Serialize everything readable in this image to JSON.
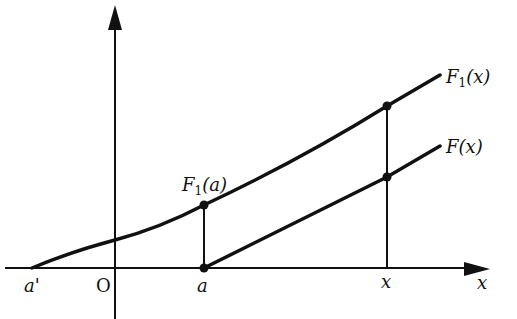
{
  "diagram": {
    "axes": {
      "x_label": "x",
      "origin_label": "O"
    },
    "x_ticks": [
      {
        "label": "a'",
        "px": 32
      },
      {
        "label": "O",
        "px": 115
      },
      {
        "label": "a",
        "px": 204
      },
      {
        "label": "x",
        "px": 387
      }
    ],
    "curves": [
      {
        "name": "F1",
        "label_main": "F",
        "label_sub": "1",
        "label_arg": "(x)"
      },
      {
        "name": "F",
        "label_main": "F",
        "label_arg": "(x)"
      }
    ],
    "points": {
      "f1_at_a": {
        "label_main": "F",
        "label_sub": "1",
        "label_arg": "(a)"
      }
    },
    "colors": {
      "ink": "#111111",
      "background": "#ffffff"
    }
  }
}
